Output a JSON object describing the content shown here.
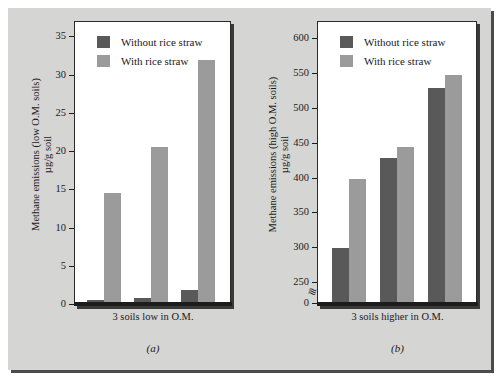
{
  "figure": {
    "background_color": "#d5d5d4",
    "dark_series_color": "#595959",
    "light_series_color": "#9b9b9b"
  },
  "legend": {
    "without_label": "Without rice straw",
    "with_label": "With rice straw"
  },
  "panel_a": {
    "caption": "(a)",
    "xlabel": "3 soils low in O.M.",
    "ytitle_line1": "Methane emissions (low O.M. soils)",
    "ytitle_line2": "µg/g soil",
    "yticks": [
      "0",
      "5",
      "10",
      "15",
      "20",
      "25",
      "30",
      "35"
    ]
  },
  "panel_b": {
    "caption": "(b)",
    "xlabel": "3 soils higher in O.M.",
    "ytitle_line1": "Methane emissions (high O.M. soils)",
    "ytitle_line2": "µg/g soil",
    "yticks": [
      "0",
      "250",
      "300",
      "350",
      "400",
      "450",
      "500",
      "550",
      "600"
    ],
    "axis_break_glyph": "≈"
  },
  "chart_data": [
    {
      "type": "bar",
      "title": "(a)",
      "xlabel": "3 soils low in O.M.",
      "ylabel": "Methane emissions (low O.M. soils) µg/g soil",
      "categories": [
        "Soil 1",
        "Soil 2",
        "Soil 3"
      ],
      "ylim": [
        0,
        37
      ],
      "yticks": [
        0,
        5,
        10,
        15,
        20,
        25,
        30,
        35
      ],
      "grid": false,
      "legend_position": "top-left",
      "axis_break": false,
      "series": [
        {
          "name": "Without rice straw",
          "color": "#595959",
          "values": [
            0.7,
            0.9,
            2.0
          ]
        },
        {
          "name": "With rice straw",
          "color": "#9b9b9b",
          "values": [
            14.7,
            20.7,
            32.0
          ]
        }
      ]
    },
    {
      "type": "bar",
      "title": "(b)",
      "xlabel": "3 soils higher in O.M.",
      "ylabel": "Methane emissions (high O.M. soils) µg/g soil",
      "categories": [
        "Soil 1",
        "Soil 2",
        "Soil 3"
      ],
      "ylim": [
        250,
        625
      ],
      "yticks": [
        0,
        250,
        300,
        350,
        400,
        450,
        500,
        550,
        600
      ],
      "grid": false,
      "legend_position": "top-left",
      "axis_break": true,
      "axis_break_between": [
        0,
        250
      ],
      "series": [
        {
          "name": "Without rice straw",
          "color": "#595959",
          "values": [
            300,
            430,
            530
          ]
        },
        {
          "name": "With rice straw",
          "color": "#9b9b9b",
          "values": [
            400,
            445,
            549
          ]
        }
      ]
    }
  ]
}
